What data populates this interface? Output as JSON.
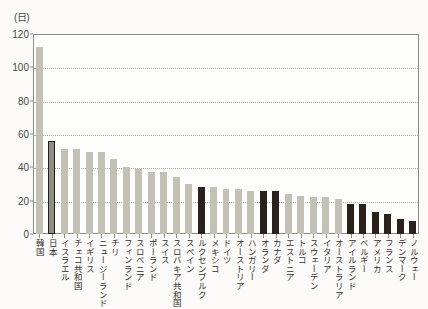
{
  "chart_data": {
    "type": "bar",
    "title": "",
    "subtitle": "",
    "xlabel": "",
    "ylabel": "",
    "unit_label": "(日)",
    "ylim": [
      0,
      120
    ],
    "yticks": [
      0,
      20,
      40,
      60,
      80,
      100,
      120
    ],
    "ytick_labels": [
      "0",
      "20",
      "40",
      "60",
      "80",
      "100",
      "120"
    ],
    "grid": true,
    "grid_axis": "y",
    "legend": "none",
    "legend_position": "none",
    "categories": [
      "韓国",
      "日本",
      "イスラエル",
      "チェコ共和国",
      "イギリス",
      "ニュージーランド",
      "チリ",
      "フィンランド",
      "スロベニア",
      "ポーランド",
      "スイス",
      "スロバキア共和国",
      "スペイン",
      "ルクセンブルク",
      "メキシコ",
      "ドイツ",
      "オーストリア",
      "ハンガリー",
      "オランダ",
      "カナダ",
      "エストニア",
      "トルコ",
      "スウェーデン",
      "イタリア",
      "オーストラリア",
      "アイルランド",
      "ベルギー",
      "アメリカ",
      "フランス",
      "デンマーク",
      "ノルウェー"
    ],
    "values": [
      112,
      56,
      51,
      51,
      49,
      49,
      45,
      40,
      39,
      37,
      37,
      34,
      30,
      28,
      28,
      27,
      27,
      26,
      26,
      26,
      24,
      23,
      22,
      22,
      21,
      18,
      18,
      13,
      12,
      9,
      8
    ],
    "bar_styles": [
      "light",
      "outlined",
      "light",
      "light",
      "light",
      "light",
      "light",
      "light",
      "light",
      "light",
      "light",
      "light",
      "light",
      "dark",
      "light",
      "light",
      "light",
      "light",
      "dark",
      "dark",
      "light",
      "light",
      "light",
      "light",
      "light",
      "dark",
      "dark",
      "dark",
      "dark",
      "dark",
      "dark"
    ],
    "colors": {
      "light_bar": "#c3c1b6",
      "dark_bar": "#2b211c",
      "highlight_bar_fill": "#8f8e84",
      "highlight_bar_border": "#24201c",
      "axis": "#8d8d84",
      "gridline": "#b3aea2",
      "text": "#332f2b",
      "background": "#fbfaf8"
    }
  }
}
